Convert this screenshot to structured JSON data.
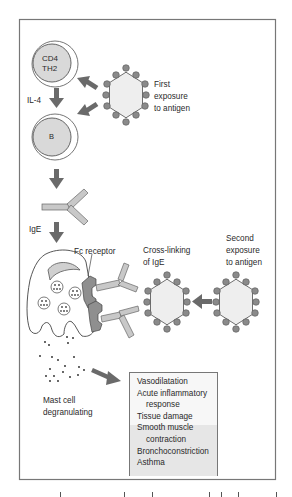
{
  "figure": {
    "colors": {
      "frame": "#777777",
      "cell_fill": "#d9d9d9",
      "cell_outline": "#555555",
      "antigen_fill": "#eeeeee",
      "antigen_dot": "#8a8a8a",
      "arrow": "#6a6a6a",
      "antibody": "#c8c8c8",
      "receptor": "#8f8f8f",
      "effects_box_upper": "#f7f7f7",
      "effects_box_lower": "#e6e6e6"
    }
  },
  "cells": {
    "th2": {
      "line1": "CD4",
      "line2": "TH2"
    },
    "b_cell": {
      "label": "B"
    },
    "mast_cell": {
      "label_line1": "Mast cell",
      "label_line2": "degranulating"
    }
  },
  "labels": {
    "il4": "IL-4",
    "ige": "IgE",
    "fc_receptor": "Fc receptor",
    "first_exposure": [
      "First",
      "exposure",
      "to antigen"
    ],
    "cross_linking": [
      "Cross-linking",
      "of IgE"
    ],
    "second_exposure": [
      "Second",
      "exposure",
      "to antigen"
    ]
  },
  "effects": [
    {
      "text": "Vasodilatation",
      "indent": false
    },
    {
      "text": "Acute inflammatory",
      "indent": false
    },
    {
      "text": "response",
      "indent": true
    },
    {
      "text": "Tissue damage",
      "indent": false
    },
    {
      "text": "Smooth muscle",
      "indent": false
    },
    {
      "text": "contraction",
      "indent": true
    },
    {
      "text": "Bronchoconstriction",
      "indent": false
    },
    {
      "text": "Asthma",
      "indent": false
    }
  ]
}
